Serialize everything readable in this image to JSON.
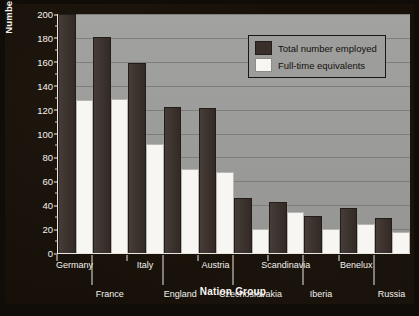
{
  "chart_data": {
    "type": "bar",
    "title": "",
    "xlabel": "Nation Group",
    "ylabel": "Number of Composers",
    "ylim": [
      0,
      200
    ],
    "yticks": [
      0,
      20,
      40,
      60,
      80,
      100,
      120,
      140,
      160,
      180,
      200
    ],
    "grid": true,
    "legend_position": "top-right",
    "categories": [
      "Germany",
      "France",
      "Italy",
      "England",
      "Austria",
      "Czechoslovakia",
      "Scandinavia",
      "Iberia",
      "Benelux",
      "Russia"
    ],
    "series": [
      {
        "name": "Total number employed",
        "color": "#3a302b",
        "values": [
          200,
          181,
          159,
          122,
          121,
          46,
          43,
          31,
          38,
          29
        ]
      },
      {
        "name": "Full-time equivalents",
        "color": "#f7f6f2",
        "values": [
          128,
          129,
          91,
          70,
          68,
          20,
          34,
          20,
          24,
          18
        ]
      }
    ]
  },
  "legend": {
    "items": [
      {
        "label": "Total number employed",
        "swatch": "dark"
      },
      {
        "label": "Full-time equivalents",
        "swatch": "light"
      }
    ]
  },
  "axes": {
    "y_title": "Number of Composers",
    "x_title": "Nation Group"
  },
  "colors": {
    "plot_background": "#9d9d9b",
    "figure_background": "#161009",
    "series_dark": "#3a302b",
    "series_light": "#f7f6f2",
    "axis_text": "#f4f2ee"
  }
}
